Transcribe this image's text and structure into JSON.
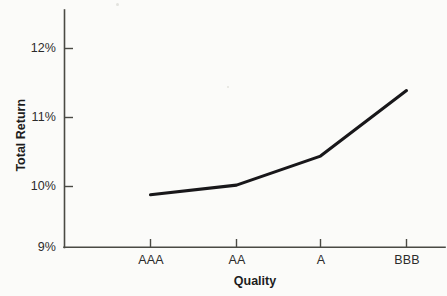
{
  "chart_data": {
    "type": "line",
    "title": "",
    "subtitle": "",
    "xlabel": "Quality",
    "ylabel": "Total Return",
    "categories": [
      "AAA",
      "AA",
      "A",
      "BBB"
    ],
    "values": [
      9.88,
      10.02,
      10.44,
      11.39
    ],
    "series": [
      {
        "name": "Total Return",
        "values": [
          9.88,
          10.02,
          10.44,
          11.39
        ],
        "color": "#18171a"
      }
    ],
    "ytick_labels": [
      "12%",
      "11%",
      "10%",
      "9%"
    ],
    "ytick_values": [
      12,
      11,
      10,
      9
    ],
    "xtick_labels": [
      "AAA",
      "AA",
      "A",
      "BBB"
    ],
    "ylim": [
      9,
      12.55
    ],
    "xlim": [
      0,
      1
    ],
    "grid": false,
    "legend": false,
    "legend_position": "none",
    "annotations": []
  },
  "axes": {
    "y_axis_label": "Total Return",
    "x_axis_label": "Quality",
    "y_ticks": [
      {
        "label": "12%",
        "value": 12
      },
      {
        "label": "11%",
        "value": 11
      },
      {
        "label": "10%",
        "value": 10
      },
      {
        "label": "9%",
        "value": 9
      }
    ],
    "x_ticks": [
      {
        "label": "AAA",
        "value": 9.88
      },
      {
        "label": "AA",
        "value": 10.02
      },
      {
        "label": "A",
        "value": 10.44
      },
      {
        "label": "BBB",
        "value": 11.39
      }
    ]
  },
  "style": {
    "background_color": "#fbfbf9",
    "line_color": "#18171a",
    "axis_color": "#4a4a44",
    "text_color": "#2b2b2b",
    "label_color": "#1d1d1d"
  }
}
